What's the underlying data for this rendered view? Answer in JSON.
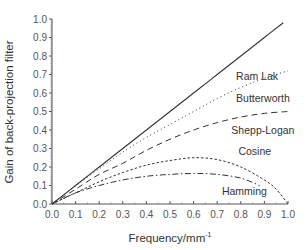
{
  "chart_data": {
    "type": "line",
    "title": "",
    "xlabel": "Frequency/mm",
    "xlabel_sup": "-1",
    "ylabel": "Gain of back-projection filter",
    "xlim": [
      0.0,
      1.0
    ],
    "ylim": [
      0.0,
      1.0
    ],
    "grid": false,
    "legend_position": "inline labels",
    "x_ticks": [
      "0.0",
      "0.1",
      "0.2",
      "0.3",
      "0.4",
      "0.5",
      "0.6",
      "0.7",
      "0.8",
      "0.9",
      "1.0"
    ],
    "y_ticks": [
      "0.0",
      "0.1",
      "0.2",
      "0.3",
      "0.4",
      "0.5",
      "0.6",
      "0.7",
      "0.8",
      "0.9",
      "1.0"
    ],
    "series": [
      {
        "name": "Ram Lak",
        "style": "solid",
        "x": [
          0.0,
          0.1,
          0.2,
          0.3,
          0.4,
          0.5,
          0.6,
          0.7,
          0.8,
          0.9,
          0.98
        ],
        "y": [
          0.0,
          0.1,
          0.2,
          0.3,
          0.4,
          0.5,
          0.6,
          0.7,
          0.8,
          0.9,
          0.98
        ],
        "label_pos": [
          0.78,
          0.67
        ]
      },
      {
        "name": "Butterworth",
        "style": "dotted",
        "x": [
          0.0,
          0.1,
          0.2,
          0.3,
          0.4,
          0.5,
          0.6,
          0.7,
          0.8,
          0.9,
          1.0
        ],
        "y": [
          0.0,
          0.1,
          0.19,
          0.28,
          0.36,
          0.43,
          0.5,
          0.57,
          0.63,
          0.68,
          0.72
        ],
        "label_pos": [
          0.78,
          0.55
        ]
      },
      {
        "name": "Shepp-Logan",
        "style": "dashed",
        "x": [
          0.0,
          0.1,
          0.2,
          0.3,
          0.4,
          0.5,
          0.6,
          0.7,
          0.8,
          0.9,
          1.0
        ],
        "y": [
          0.0,
          0.08,
          0.16,
          0.22,
          0.29,
          0.35,
          0.4,
          0.44,
          0.47,
          0.49,
          0.5
        ],
        "label_pos": [
          0.76,
          0.38
        ]
      },
      {
        "name": "Cosine",
        "style": "short-dashed",
        "x": [
          0.0,
          0.1,
          0.2,
          0.3,
          0.4,
          0.5,
          0.6,
          0.7,
          0.8,
          0.9,
          0.95,
          1.0
        ],
        "y": [
          0.0,
          0.06,
          0.12,
          0.17,
          0.21,
          0.235,
          0.25,
          0.24,
          0.2,
          0.13,
          0.08,
          0.0
        ],
        "label_pos": [
          0.79,
          0.265
        ]
      },
      {
        "name": "Hamming",
        "style": "dash-dot",
        "x": [
          0.0,
          0.1,
          0.2,
          0.3,
          0.4,
          0.5,
          0.6,
          0.7,
          0.8,
          0.88
        ],
        "y": [
          0.0,
          0.06,
          0.1,
          0.13,
          0.15,
          0.16,
          0.165,
          0.16,
          0.14,
          0.1
        ],
        "label_pos": [
          0.72,
          0.05
        ]
      }
    ]
  }
}
